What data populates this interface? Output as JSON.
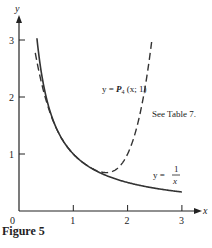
{
  "chart_data": {
    "type": "line",
    "title": "",
    "xlabel": "x",
    "ylabel": "y",
    "xlim": [
      0,
      3.25
    ],
    "ylim": [
      0,
      3.3
    ],
    "x_ticks": [
      1,
      2,
      3
    ],
    "y_ticks": [
      1,
      2,
      3
    ],
    "origin_label": "0",
    "grid": false,
    "series": [
      {
        "name": "y = 1/x",
        "style": "solid",
        "function": "1/x",
        "x_range": [
          0.33,
          3.0
        ],
        "x": [
          0.33,
          0.5,
          0.75,
          1.0,
          1.25,
          1.5,
          2.0,
          2.5,
          3.0
        ],
        "y": [
          3.0,
          2.0,
          1.333,
          1.0,
          0.8,
          0.667,
          0.5,
          0.4,
          0.333
        ]
      },
      {
        "name": "y = P4(x; 1)",
        "style": "dashed",
        "function": "Taylor polynomial degree 4 of 1/x about x=1",
        "x_range": [
          0.3,
          2.45
        ],
        "x": [
          0.3,
          0.5,
          0.75,
          1.0,
          1.25,
          1.5,
          1.75,
          2.0,
          2.25,
          2.45
        ],
        "y": [
          3.0,
          1.94,
          1.332,
          1.0,
          0.804,
          0.688,
          0.73,
          1.0,
          1.63,
          2.5
        ]
      }
    ],
    "annotations": [
      {
        "text_main": "y = ",
        "text_func": "P",
        "text_sub": "4",
        "text_args": " (x; 1)"
      },
      {
        "text": "See Table 7."
      },
      {
        "text_lhs": "y = ",
        "num": "1",
        "den": "x"
      }
    ]
  },
  "caption": "Figure 5"
}
